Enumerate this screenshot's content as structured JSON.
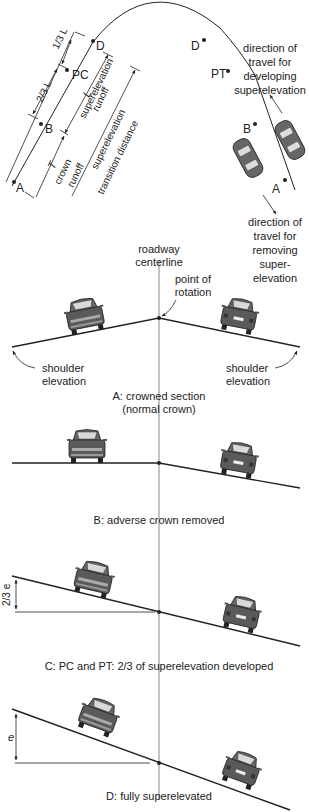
{
  "plan_view": {
    "left_points": {
      "D": "D",
      "PC": "PC",
      "B": "B",
      "A": "A"
    },
    "right_points": {
      "D": "D",
      "PT": "PT",
      "B": "B",
      "A": "A"
    },
    "dims": {
      "one_third_L": "1/3 L",
      "two_thirds_L": "2/3 L",
      "L": "L",
      "TR": "T",
      "TR_sub": "R"
    },
    "labels": {
      "runoff_1": "superelevation",
      "runoff_2": "runoff",
      "crown_1": "crown",
      "crown_2": "runoff",
      "transition_1": "superelevation",
      "transition_2": "transition distance"
    },
    "developing": [
      "direction of",
      "travel for",
      "developing",
      "superelevation"
    ],
    "removing": [
      "direction of",
      "travel for",
      "removing",
      "super-",
      "elevation"
    ]
  },
  "sections": {
    "centerline": [
      "roadway",
      "centerline"
    ],
    "rotation": [
      "point of",
      "rotation"
    ],
    "shoulder_left": [
      "shoulder",
      "elevation"
    ],
    "shoulder_right": [
      "shoulder",
      "elevation"
    ],
    "a_caption": [
      "A: crowned section",
      "(normal crown)"
    ],
    "b_caption": "B: adverse crown removed",
    "c_caption": "C: PC and PT: 2/3 of superelevation developed",
    "c_dim": "2/3 e",
    "d_caption": "D: fully superelevated",
    "d_dim": "e"
  },
  "colors": {
    "line": "#222222",
    "car_body": "#5a5a5a",
    "car_dark": "#3a3a3a",
    "car_light": "#a9a9a9",
    "centerline": "#888888"
  }
}
